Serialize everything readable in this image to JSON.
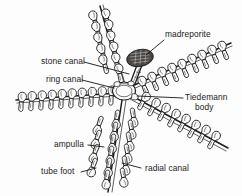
{
  "figure": {
    "background_color": "#fdfdfd",
    "ink_color": "#1d1d1d",
    "label_color": "#1a1a1a"
  },
  "labels": {
    "madreporite": "madreporite",
    "stone_canal": "stone canal",
    "ring_canal": "ring canal",
    "tiedemann_line1": "Tiedemann",
    "tiedemann_line2": "body",
    "ampulla": "ampulla",
    "tube_foot": "tube foot",
    "radial_canal": "radial canal"
  },
  "structures": {
    "madreporite": {
      "name": "madreporite",
      "shape": "stippled oval sieve plate",
      "color": "#4a4744",
      "cx": 140,
      "cy": 58,
      "rx": 13,
      "ry": 8
    },
    "ring_canal": {
      "name": "ring canal",
      "shape": "central ring",
      "cx": 124,
      "cy": 91,
      "r": 11
    },
    "stone_canal": {
      "name": "stone canal",
      "shape": "tube from madreporite to ring canal"
    },
    "tiedemann_body": {
      "name": "Tiedemann body",
      "shape": "small pouch on ring canal"
    },
    "arms": [
      {
        "name": "upper-left-arm",
        "angle_deg": -108,
        "podia_pairs": 8
      },
      {
        "name": "upper-right-arm",
        "angle_deg": -34,
        "podia_pairs": 10
      },
      {
        "name": "left-arm",
        "angle_deg": 176,
        "podia_pairs": 10
      },
      {
        "name": "lower-right-arm",
        "angle_deg": 32,
        "podia_pairs": 10
      },
      {
        "name": "lower-arm",
        "angle_deg": 74,
        "podia_pairs": 9
      }
    ],
    "podium": {
      "ampulla": "rounded bulb above radial canal",
      "tube_foot": "narrow stalk below radial canal"
    }
  }
}
